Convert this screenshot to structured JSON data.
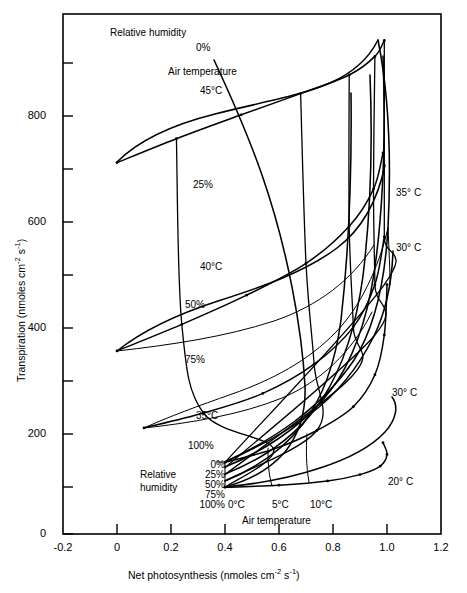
{
  "figure": {
    "background": "#ffffff",
    "line_color": "#000000",
    "frame": {
      "left": 63,
      "top": 14,
      "right": 441,
      "bottom": 534
    }
  },
  "chart_data": {
    "type": "line",
    "title": "",
    "xlabel_parts": {
      "main": "Net photosynthesis (nmoles cm",
      "sup1": "-2",
      "mid": " s",
      "sup2": "-1",
      "end": ")"
    },
    "ylabel_parts": {
      "main": "Transpiration (nmoles cm",
      "sup1": "-2",
      "mid": " s",
      "sup2": "-1",
      "end": ")"
    },
    "xlabel": "Net photosynthesis (nmoles cm-2 s-1)",
    "ylabel": "Transpiration (nmoles cm-2 s-1)",
    "xlim": [
      -0.2,
      1.2
    ],
    "ylim": [
      0,
      980
    ],
    "xticks": [
      -0.2,
      0,
      0.2,
      0.4,
      0.6,
      0.8,
      1.0,
      1.2
    ],
    "xticklabels": [
      "-0.2",
      "0",
      "0.2",
      "0.4",
      "0.6",
      "0.8",
      "1.0",
      "1.2"
    ],
    "yticks": [
      0,
      100,
      200,
      300,
      400,
      500,
      600,
      700,
      800,
      900
    ],
    "yticklabels": [
      "0",
      "",
      "200",
      "",
      "400",
      "",
      "600",
      "",
      "800",
      ""
    ],
    "grid": false,
    "legend_position": "inside-lower-left",
    "parameter_axes": {
      "axis_1_name": "Air temperature",
      "axis_1_values": [
        "0°C",
        "5°C",
        "10°C",
        "20°C",
        "30°C",
        "35°C",
        "40°C",
        "45°C"
      ],
      "axis_2_name": "Relative humidity",
      "axis_2_values": [
        "0%",
        "25%",
        "50%",
        "75%",
        "100%"
      ]
    },
    "series": [
      {
        "name": "45°C isotherm",
        "kind": "isotherm",
        "temperature": "45°C",
        "x": [
          0.0,
          0.22,
          0.46,
          0.68,
          0.86,
          0.955,
          0.99
        ],
        "y": [
          700,
          745,
          790,
          830,
          865,
          900,
          930
        ]
      },
      {
        "name": "40°C isotherm",
        "kind": "isotherm",
        "temperature": "40°C",
        "x": [
          0.0,
          0.24,
          0.48,
          0.7,
          0.86,
          0.95,
          0.985
        ],
        "y": [
          345,
          395,
          450,
          510,
          580,
          650,
          718
        ]
      },
      {
        "name": "35°C isotherm",
        "kind": "isotherm",
        "temperature": "35°C",
        "x": [
          0.1,
          0.32,
          0.54,
          0.73,
          0.875,
          0.955,
          0.99
        ],
        "y": [
          200,
          228,
          265,
          320,
          390,
          470,
          560
        ]
      },
      {
        "name": "30°C isotherm",
        "kind": "isotherm",
        "temperature": "30°C",
        "x": [
          0.4,
          0.58,
          0.74,
          0.875,
          0.955,
          0.99,
          1.0
        ],
        "y": [
          135,
          160,
          195,
          240,
          300,
          375,
          470
        ]
      },
      {
        "name": "20°C isotherm",
        "kind": "isotherm",
        "temperature": "20°C",
        "x": [
          0.4,
          0.6,
          0.78,
          0.9,
          0.975,
          1.0,
          0.985
        ],
        "y": [
          88,
          92,
          100,
          112,
          128,
          150,
          172
        ]
      },
      {
        "name": "0% relative humidity",
        "kind": "iso-rh",
        "humidity": "0%",
        "x": [
          0.4,
          0.99,
          0.99,
          0.99,
          0.99
        ],
        "y": [
          135,
          470,
          560,
          718,
          930
        ]
      },
      {
        "name": "25% relative humidity",
        "kind": "iso-rh",
        "humidity": "25%",
        "x": [
          0.4,
          0.955,
          0.955,
          0.95,
          0.955
        ],
        "y": [
          125,
          375,
          470,
          650,
          900
        ]
      },
      {
        "name": "50% relative humidity",
        "kind": "iso-rh",
        "humidity": "50%",
        "x": [
          0.4,
          0.875,
          0.875,
          0.86,
          0.86
        ],
        "y": [
          112,
          300,
          390,
          580,
          865
        ]
      },
      {
        "name": "75% relative humidity",
        "kind": "iso-rh",
        "humidity": "75%",
        "x": [
          0.4,
          0.74,
          0.73,
          0.7,
          0.68
        ],
        "y": [
          100,
          195,
          320,
          510,
          830
        ]
      },
      {
        "name": "100% relative humidity",
        "kind": "iso-rh",
        "humidity": "100%",
        "x": [
          0.4,
          0.58,
          0.32,
          0.24,
          0.22
        ],
        "y": [
          88,
          160,
          228,
          395,
          745
        ]
      }
    ],
    "annotations": [
      {
        "text": "Relative humidity",
        "x": 0.07,
        "y": 935,
        "name": "annotation-relative-humidity-top"
      },
      {
        "text": "0%",
        "x": 0.3,
        "y": 900,
        "name": "annotation-0-percent-top"
      },
      {
        "text": "Air  temperature",
        "x": 0.27,
        "y": 845,
        "name": "annotation-air-temperature-top"
      },
      {
        "text": "45°C",
        "x": 0.35,
        "y": 805,
        "name": "annotation-45C"
      },
      {
        "text": "25%",
        "x": 0.3,
        "y": 645,
        "name": "annotation-25-percent"
      },
      {
        "text": "40°C",
        "x": 0.35,
        "y": 490,
        "name": "annotation-40C"
      },
      {
        "text": "50%",
        "x": 0.27,
        "y": 442,
        "name": "annotation-50-percent"
      },
      {
        "text": "75%",
        "x": 0.27,
        "y": 357,
        "name": "annotation-75-percent"
      },
      {
        "text": "35°C",
        "x": 0.33,
        "y": 245,
        "name": "annotation-35C-inner"
      },
      {
        "text": "100%",
        "x": 0.32,
        "y": 180,
        "name": "annotation-100-percent-inner"
      },
      {
        "text": "35° C",
        "x": 1.05,
        "y": 600,
        "name": "annotation-35C-right"
      },
      {
        "text": "30° C",
        "x": 1.05,
        "y": 490,
        "name": "annotation-30C-right-upper"
      },
      {
        "text": "30° C",
        "x": 1.05,
        "y": 265,
        "name": "annotation-30C-right-lower"
      },
      {
        "text": "20° C",
        "x": 1.04,
        "y": 118,
        "name": "annotation-20C-right"
      }
    ],
    "inner_legend": {
      "title_line1": "Relative",
      "title_line2": "humidity",
      "humidity_labels": [
        "0%",
        "25%",
        "50%",
        "75%",
        "100%"
      ],
      "temperature_labels": [
        "0°C",
        "5°C",
        "10°C"
      ],
      "temperature_axis_caption": "Air temperature"
    }
  }
}
